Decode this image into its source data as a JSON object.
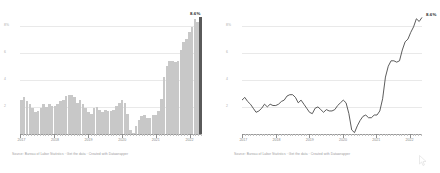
{
  "chart_data": [
    {
      "type": "bar",
      "title": "",
      "xlabel": "",
      "ylabel": "",
      "ylim": [
        0,
        9
      ],
      "grid": true,
      "ytick_labels": [
        "8%",
        "6",
        "4",
        "2"
      ],
      "ytick_values": [
        8,
        6,
        4,
        2
      ],
      "xtick_labels": [
        "2017",
        "2018",
        "2019",
        "2020",
        "2021",
        "2022"
      ],
      "highlight_last": true,
      "peak_label": "8.6%",
      "categories": [
        "2017-01",
        "2017-02",
        "2017-03",
        "2017-04",
        "2017-05",
        "2017-06",
        "2017-07",
        "2017-08",
        "2017-09",
        "2017-10",
        "2017-11",
        "2017-12",
        "2018-01",
        "2018-02",
        "2018-03",
        "2018-04",
        "2018-05",
        "2018-06",
        "2018-07",
        "2018-08",
        "2018-09",
        "2018-10",
        "2018-11",
        "2018-12",
        "2019-01",
        "2019-02",
        "2019-03",
        "2019-04",
        "2019-05",
        "2019-06",
        "2019-07",
        "2019-08",
        "2019-09",
        "2019-10",
        "2019-11",
        "2019-12",
        "2020-01",
        "2020-02",
        "2020-03",
        "2020-04",
        "2020-05",
        "2020-06",
        "2020-07",
        "2020-08",
        "2020-09",
        "2020-10",
        "2020-11",
        "2020-12",
        "2021-01",
        "2021-02",
        "2021-03",
        "2021-04",
        "2021-05",
        "2021-06",
        "2021-07",
        "2021-08",
        "2021-09",
        "2021-10",
        "2021-11",
        "2021-12",
        "2022-01",
        "2022-02",
        "2022-03",
        "2022-04",
        "2022-05"
      ],
      "values": [
        2.5,
        2.7,
        2.4,
        2.2,
        1.9,
        1.6,
        1.7,
        1.9,
        2.2,
        2.0,
        2.2,
        2.1,
        2.1,
        2.2,
        2.4,
        2.5,
        2.8,
        2.9,
        2.9,
        2.7,
        2.3,
        2.5,
        2.2,
        1.9,
        1.6,
        1.5,
        1.9,
        2.0,
        1.8,
        1.6,
        1.8,
        1.7,
        1.7,
        1.8,
        2.1,
        2.3,
        2.5,
        2.3,
        1.5,
        0.3,
        0.1,
        0.6,
        1.0,
        1.3,
        1.4,
        1.2,
        1.2,
        1.4,
        1.4,
        1.7,
        2.6,
        4.2,
        5.0,
        5.4,
        5.4,
        5.3,
        5.4,
        6.2,
        6.8,
        7.0,
        7.5,
        7.9,
        8.5,
        8.3,
        8.6
      ],
      "source": "Source: Bureau of Labor Statistics · Get the data · Created with Datawrapper"
    },
    {
      "type": "line",
      "title": "",
      "xlabel": "",
      "ylabel": "",
      "ylim": [
        0,
        9
      ],
      "grid": true,
      "ytick_labels": [
        "8%",
        "6",
        "4",
        "2"
      ],
      "ytick_values": [
        8,
        6,
        4,
        2
      ],
      "xtick_labels": [
        "2017",
        "2018",
        "2019",
        "2020",
        "2021",
        "2022"
      ],
      "peak_label": "8.6%",
      "x": [
        "2017-01",
        "2017-02",
        "2017-03",
        "2017-04",
        "2017-05",
        "2017-06",
        "2017-07",
        "2017-08",
        "2017-09",
        "2017-10",
        "2017-11",
        "2017-12",
        "2018-01",
        "2018-02",
        "2018-03",
        "2018-04",
        "2018-05",
        "2018-06",
        "2018-07",
        "2018-08",
        "2018-09",
        "2018-10",
        "2018-11",
        "2018-12",
        "2019-01",
        "2019-02",
        "2019-03",
        "2019-04",
        "2019-05",
        "2019-06",
        "2019-07",
        "2019-08",
        "2019-09",
        "2019-10",
        "2019-11",
        "2019-12",
        "2020-01",
        "2020-02",
        "2020-03",
        "2020-04",
        "2020-05",
        "2020-06",
        "2020-07",
        "2020-08",
        "2020-09",
        "2020-10",
        "2020-11",
        "2020-12",
        "2021-01",
        "2021-02",
        "2021-03",
        "2021-04",
        "2021-05",
        "2021-06",
        "2021-07",
        "2021-08",
        "2021-09",
        "2021-10",
        "2021-11",
        "2021-12",
        "2022-01",
        "2022-02",
        "2022-03",
        "2022-04",
        "2022-05"
      ],
      "values": [
        2.5,
        2.7,
        2.4,
        2.2,
        1.9,
        1.6,
        1.7,
        1.9,
        2.2,
        2.0,
        2.2,
        2.1,
        2.1,
        2.2,
        2.4,
        2.5,
        2.8,
        2.9,
        2.9,
        2.7,
        2.3,
        2.5,
        2.2,
        1.9,
        1.6,
        1.5,
        1.9,
        2.0,
        1.8,
        1.6,
        1.8,
        1.7,
        1.7,
        1.8,
        2.1,
        2.3,
        2.5,
        2.3,
        1.5,
        0.3,
        0.1,
        0.6,
        1.0,
        1.3,
        1.4,
        1.2,
        1.2,
        1.4,
        1.4,
        1.7,
        2.6,
        4.2,
        5.0,
        5.4,
        5.4,
        5.3,
        5.4,
        6.2,
        6.8,
        7.0,
        7.5,
        7.9,
        8.5,
        8.3,
        8.6
      ],
      "source": "Source: Bureau of Labor Statistics · Get the data · Created with Datawrapper"
    }
  ],
  "left_panel": {
    "caption": "Source: Bureau of Labor Statistics · Get the data · Created with Datawrapper",
    "peak_label": "8.6%"
  },
  "right_panel": {
    "caption": "Source: Bureau of Labor Statistics · Get the data · Created with Datawrapper",
    "peak_label": "8.6%"
  },
  "cursor": {
    "icon": "mouse-pointer-icon"
  },
  "colors": {
    "bar": "#c8c8c8",
    "bar_highlight": "#5a5a5a",
    "line": "#4a4a4a",
    "grid": "#e9e9e9",
    "axis": "#9a9a9a",
    "label": "#8a8a8a",
    "caption": "#9c9c9c"
  }
}
